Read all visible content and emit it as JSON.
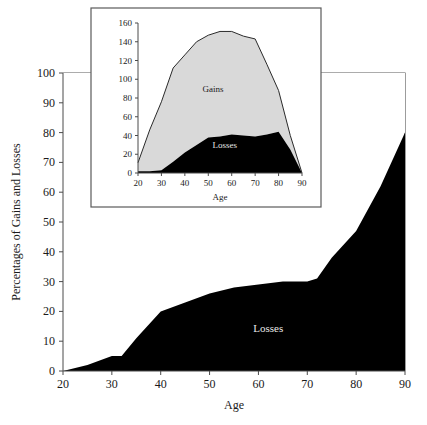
{
  "chart_data": [
    {
      "id": "main",
      "type": "area",
      "title": "",
      "xlabel": "Age",
      "ylabel": "Percentages of Gains and Losses",
      "xlim": [
        20,
        90
      ],
      "ylim": [
        0,
        100
      ],
      "xticks": [
        20,
        30,
        40,
        50,
        60,
        70,
        80,
        90
      ],
      "yticks": [
        0,
        10,
        20,
        30,
        40,
        50,
        60,
        70,
        80,
        90,
        100
      ],
      "grid": false,
      "legend_position": "inline-annotations",
      "x": [
        20,
        25,
        30,
        32,
        35,
        40,
        45,
        50,
        55,
        60,
        65,
        70,
        72,
        75,
        80,
        85,
        90
      ],
      "series": [
        {
          "name": "Losses",
          "color": "#000000",
          "values": [
            0,
            2,
            5,
            5,
            11,
            20,
            23,
            26,
            28,
            29,
            30,
            30,
            31,
            38,
            47,
            62,
            80
          ]
        },
        {
          "name": "Gains",
          "color": "#ffffff",
          "values": [
            100,
            98,
            95,
            95,
            89,
            80,
            77,
            74,
            72,
            71,
            70,
            70,
            69,
            62,
            53,
            38,
            20
          ]
        }
      ],
      "annotations": [
        {
          "text": "Gains",
          "x": 32,
          "y": 57
        },
        {
          "text": "Losses",
          "x": 62,
          "y": 13
        }
      ]
    },
    {
      "id": "inset",
      "type": "area",
      "title": "",
      "xlabel": "Age",
      "ylabel": "",
      "xlim": [
        20,
        90
      ],
      "ylim": [
        0,
        160
      ],
      "xticks": [
        20,
        30,
        40,
        50,
        60,
        70,
        80,
        90
      ],
      "yticks": [
        0,
        20,
        40,
        60,
        80,
        100,
        120,
        140,
        160
      ],
      "grid": false,
      "legend_position": "inline-annotations",
      "x": [
        20,
        25,
        30,
        35,
        40,
        45,
        50,
        55,
        60,
        65,
        70,
        75,
        80,
        85,
        90
      ],
      "series": [
        {
          "name": "Losses",
          "color": "#000000",
          "values": [
            2,
            2,
            3,
            12,
            22,
            30,
            38,
            39,
            41,
            40,
            39,
            41,
            44,
            25,
            0
          ]
        },
        {
          "name": "Gains",
          "color": "#d9d9d9",
          "values": [
            9,
            44,
            73,
            100,
            104,
            110,
            109,
            112,
            110,
            106,
            104,
            75,
            44,
            15,
            0
          ]
        }
      ],
      "totals": [
        11,
        46,
        76,
        112,
        126,
        140,
        147,
        151,
        151,
        146,
        143,
        116,
        88,
        40,
        0
      ],
      "annotations": [
        {
          "text": "Gains",
          "x": 52,
          "y": 86
        },
        {
          "text": "Losses",
          "x": 57,
          "y": 27
        }
      ]
    }
  ],
  "main_chart": {
    "ylabel": "Percentages of Gains and Losses",
    "xlabel": "Age",
    "gains_label": "Gains",
    "losses_label": "Losses",
    "yticks": [
      "0",
      "10",
      "20",
      "30",
      "40",
      "50",
      "60",
      "70",
      "80",
      "90",
      "100"
    ],
    "xticks": [
      "20",
      "30",
      "40",
      "50",
      "60",
      "70",
      "80",
      "90"
    ]
  },
  "inset_chart": {
    "xlabel": "Age",
    "gains_label": "Gains",
    "losses_label": "Losses",
    "yticks": [
      "0",
      "20",
      "40",
      "60",
      "80",
      "100",
      "120",
      "140",
      "160"
    ],
    "xticks": [
      "20",
      "30",
      "40",
      "50",
      "60",
      "70",
      "80",
      "90"
    ]
  },
  "colors": {
    "losses_fill": "#000000",
    "gains_fill_main": "#ffffff",
    "gains_fill_inset": "#d9d9d9",
    "axis": "#4a4a4a",
    "frame": "#5a5a5a",
    "text": "#1a1a1a"
  }
}
